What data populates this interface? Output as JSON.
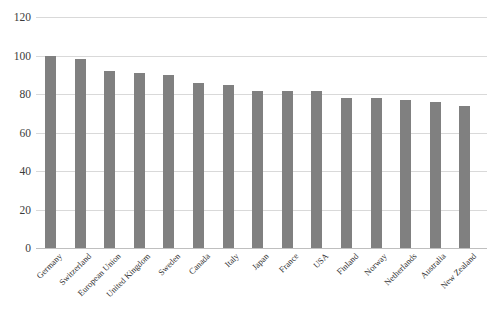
{
  "chart_data": {
    "type": "bar",
    "title": "",
    "subtitle": "",
    "xlabel": "",
    "ylabel": "",
    "ylim": [
      0,
      120
    ],
    "ytick_step": 20,
    "yticks": [
      0,
      20,
      40,
      60,
      80,
      100,
      120
    ],
    "grid": true,
    "legend": false,
    "legend_position": "none",
    "orientation": "vertical",
    "bar_color": "#808080",
    "gridline_color": "#d9d9d9",
    "background_color": "#ffffff",
    "categories": [
      "Germany",
      "Switzerland",
      "European Union",
      "United Kingdom",
      "Sweden",
      "Canada",
      "Italy",
      "Japan",
      "France",
      "USA",
      "Finland",
      "Norway",
      "Netherlands",
      "Australia",
      "New Zealand"
    ],
    "values": [
      100,
      98,
      92,
      91,
      90,
      85.5,
      84.5,
      81.5,
      81.5,
      81.5,
      78,
      78,
      77,
      76,
      74
    ],
    "series": [
      {
        "name": "",
        "values": [
          100,
          98,
          92,
          91,
          90,
          85.5,
          84.5,
          81.5,
          81.5,
          81.5,
          78,
          78,
          77,
          76,
          74
        ]
      }
    ],
    "annotations": []
  }
}
